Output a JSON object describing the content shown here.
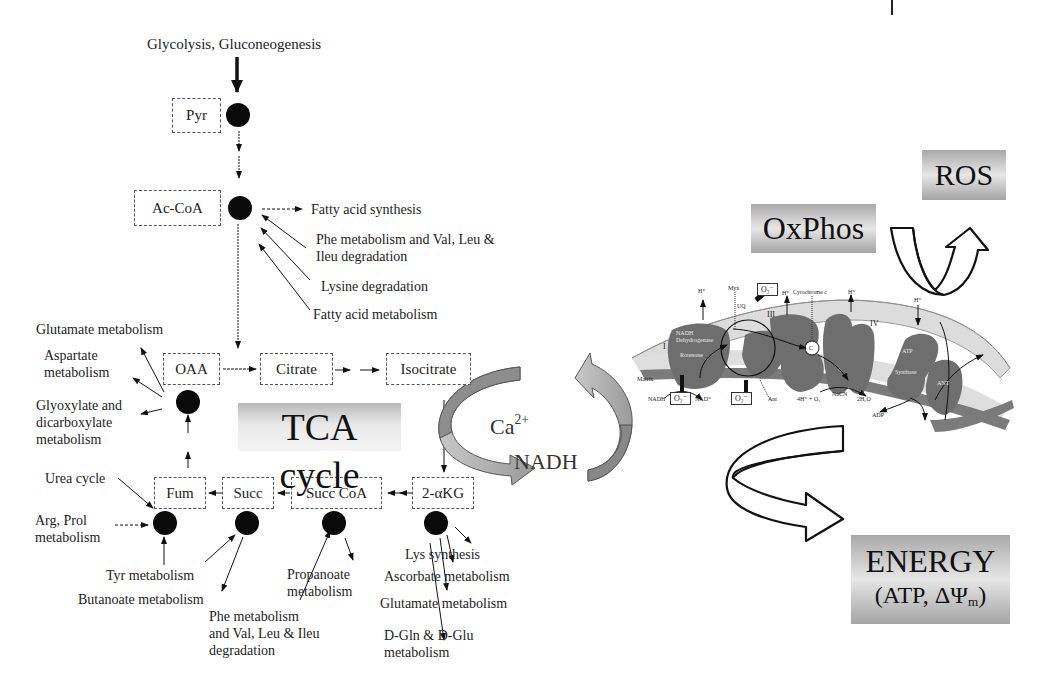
{
  "figure": {
    "input_label": "Glycolysis, Gluconeogenesis",
    "tca": {
      "title": "TCA cycle",
      "metabolites": {
        "pyr": "Pyr",
        "accoa": "Ac-CoA",
        "oaa": "OAA",
        "citrate": "Citrate",
        "isocitrate": "Isocitrate",
        "akg": "2-αKG",
        "succcoa": "Succ CoA",
        "succ": "Succ",
        "fum": "Fum"
      }
    },
    "accoa_links": {
      "out_fatty_acid_synthesis": "Fatty acid synthesis",
      "in_phe_val_leu": "Phe metabolism and Val, Leu &\nIleu degradation",
      "in_lysine": "Lysine degradation",
      "in_fatty_acid_metabolism": "Fatty acid metabolism"
    },
    "oaa_links": {
      "glutamate": "Glutamate metabolism",
      "aspartate": "Aspartate\nmetabolism",
      "glyoxylate": "Glyoxylate and\ndicarboxylate\nmetabolism"
    },
    "fum_links": {
      "urea": "Urea cycle",
      "arg_prol": "Arg, Prol\nmetabolism",
      "tyr": "Tyr metabolism"
    },
    "succ_links": {
      "butanoate": "Butanoate metabolism"
    },
    "succcoa_links": {
      "phe_val_leu": "Phe metabolism\nand Val, Leu & Ileu\ndegradation",
      "propanoate": "Propanoate\nmetabolism"
    },
    "akg_links": {
      "lys": "Lys synthesis",
      "ascorbate": "Ascorbate metabolism",
      "glutamate": "Glutamate metabolism",
      "dgln": "D-Gln & D-Glu\nmetabolism"
    },
    "coupling": {
      "calcium_base": "Ca",
      "calcium_sup": "2+",
      "nadh": "NADH"
    },
    "oxphos": {
      "title": "OxPhos",
      "ros": "ROS",
      "energy_line1": "ENERGY",
      "energy_line2_pre": "(ATP, ΔΨ",
      "energy_line2_sub": "m",
      "energy_line2_post": ")"
    },
    "etc_labels": {
      "h_plus": "H⁺",
      "mys": "Myx",
      "o2_minus": "O₂⁻",
      "cytochrome_c": "Cytochrome c",
      "uq": "UQ",
      "complex_i": "I",
      "complex_iii": "III",
      "complex_iv": "IV",
      "nadh_dehydrogenase": "NADH\nDehydrogenase",
      "rotenone": "Rotenone",
      "matrix": "Matrix",
      "nadh": "NADH",
      "nad_plus": "NAD⁺",
      "ant": "Ant",
      "water_eq": "4H⁺ + O₂",
      "nacn": "NaCN",
      "water": "2H₂O",
      "c": "C",
      "atp": "ATP",
      "synthase": "Synthase",
      "adp": "ADP",
      "ant_box": "ANT",
      "colors": {
        "protein": "#6e6e6e",
        "membrane_light": "#d8d8d8",
        "membrane_dark": "#7a7a7a"
      }
    }
  }
}
